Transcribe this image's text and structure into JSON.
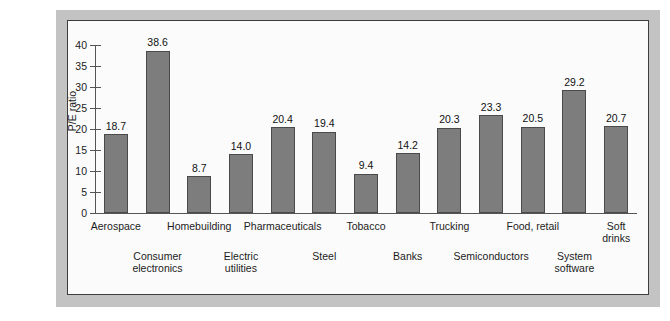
{
  "chart_data": {
    "type": "bar",
    "title": "",
    "xlabel": "",
    "ylabel": "P/E ratio",
    "ylim": [
      0,
      40
    ],
    "yticks": [
      0,
      5,
      10,
      15,
      20,
      25,
      30,
      35,
      40
    ],
    "ytick_labels": [
      "0",
      "5",
      "10",
      "15",
      "20",
      "25",
      "30",
      "35",
      "40"
    ],
    "grid": false,
    "legend": null,
    "bar_color": "#7d7d7d",
    "bar_edge_color": "#4a4a4a",
    "axis_color": "#555555",
    "panel_color": "#fbfbfb",
    "frame_color": "#c3c3c3",
    "categories": [
      "Aerospace",
      "Consumer electronics",
      "Homebuilding",
      "Electric utilities",
      "Pharmaceuticals",
      "Steel",
      "Tobacco",
      "Banks",
      "Trucking",
      "Semiconductors",
      "Food, retail",
      "System software",
      "Soft drinks"
    ],
    "values": [
      18.7,
      38.6,
      8.7,
      14.0,
      20.4,
      19.4,
      9.4,
      14.2,
      20.3,
      23.3,
      20.5,
      29.2,
      20.7
    ],
    "data_labels": [
      "18.7",
      "38.6",
      "8.7",
      "14.0",
      "20.4",
      "19.4",
      "9.4",
      "14.2",
      "20.3",
      "23.3",
      "20.5",
      "29.2",
      "20.7"
    ]
  },
  "axis": {
    "y_title": "P/E ratio",
    "y_ticks": [
      {
        "label": "40",
        "value": 40
      },
      {
        "label": "35",
        "value": 35
      },
      {
        "label": "30",
        "value": 30
      },
      {
        "label": "25",
        "value": 25
      },
      {
        "label": "20",
        "value": 20
      },
      {
        "label": "15",
        "value": 15
      },
      {
        "label": "10",
        "value": 10
      },
      {
        "label": "5",
        "value": 5
      },
      {
        "label": "0",
        "value": 0
      }
    ]
  },
  "bars": [
    {
      "value_label": "18.7",
      "value": 18.7
    },
    {
      "value_label": "38.6",
      "value": 38.6
    },
    {
      "value_label": "8.7",
      "value": 8.7
    },
    {
      "value_label": "14.0",
      "value": 14.0
    },
    {
      "value_label": "20.4",
      "value": 20.4
    },
    {
      "value_label": "19.4",
      "value": 19.4
    },
    {
      "value_label": "9.4",
      "value": 9.4
    },
    {
      "value_label": "14.2",
      "value": 14.2
    },
    {
      "value_label": "20.3",
      "value": 20.3
    },
    {
      "value_label": "23.3",
      "value": 23.3
    },
    {
      "value_label": "20.5",
      "value": 20.5
    },
    {
      "value_label": "29.2",
      "value": 29.2
    },
    {
      "value_label": "20.7",
      "value": 20.7
    }
  ],
  "category_labels": [
    {
      "line1": "Aerospace",
      "line2": "",
      "row": "top"
    },
    {
      "line1": "Consumer",
      "line2": "electronics",
      "row": "bottom"
    },
    {
      "line1": "Homebuilding",
      "line2": "",
      "row": "top"
    },
    {
      "line1": "Electric",
      "line2": "utilities",
      "row": "bottom"
    },
    {
      "line1": "Pharmaceuticals",
      "line2": "",
      "row": "top"
    },
    {
      "line1": "Steel",
      "line2": "",
      "row": "bottom"
    },
    {
      "line1": "Tobacco",
      "line2": "",
      "row": "top"
    },
    {
      "line1": "Banks",
      "line2": "",
      "row": "bottom"
    },
    {
      "line1": "Trucking",
      "line2": "",
      "row": "top"
    },
    {
      "line1": "Semiconductors",
      "line2": "",
      "row": "bottom"
    },
    {
      "line1": "Food, retail",
      "line2": "",
      "row": "top"
    },
    {
      "line1": "System",
      "line2": "software",
      "row": "bottom"
    },
    {
      "line1": "Soft",
      "line2": "drinks",
      "row": "top"
    }
  ]
}
